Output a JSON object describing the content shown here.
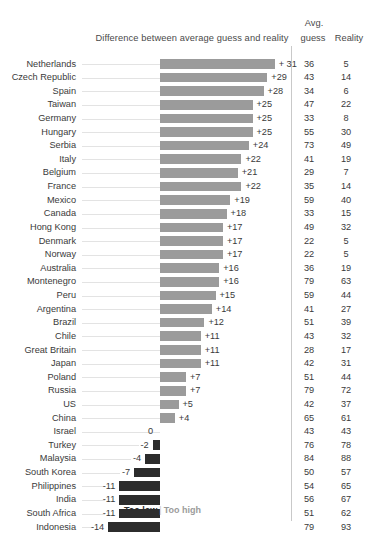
{
  "header": {
    "diff_title": "Difference between average guess and reality",
    "avg_line1": "Avg.",
    "avg_line2": "guess",
    "reality": "Reality"
  },
  "legend": {
    "too_low": "Too low",
    "separator": "|",
    "too_high": "Too high"
  },
  "colors": {
    "positive_bar": "#9b9b9b",
    "negative_bar": "#2c2c2c",
    "leader_line": "#e3e3e3",
    "divider": "#c9c9c9",
    "text": "#3a3a3a",
    "background": "#ffffff"
  },
  "chart_data": {
    "type": "bar",
    "title": "Difference between average guess and reality",
    "xlabel": "",
    "ylabel": "",
    "orientation": "horizontal",
    "grid": false,
    "legend_position": "bottom",
    "zero_line_px": 160,
    "px_per_unit": 3.7,
    "xlim": [
      -14,
      31
    ],
    "categories": [
      "Netherlands",
      "Czech Republic",
      "Spain",
      "Taiwan",
      "Germany",
      "Hungary",
      "Serbia",
      "Italy",
      "Belgium",
      "France",
      "Mexico",
      "Canada",
      "Hong Kong",
      "Denmark",
      "Norway",
      "Australia",
      "Montenegro",
      "Peru",
      "Argentina",
      "Brazil",
      "Chile",
      "Great Britain",
      "Japan",
      "Poland",
      "Russia",
      "US",
      "China",
      "Israel",
      "Turkey",
      "Malaysia",
      "South Korea",
      "Philippines",
      "India",
      "South Africa",
      "Indonesia"
    ],
    "series": [
      {
        "name": "Difference",
        "values": [
          31,
          29,
          28,
          25,
          25,
          25,
          24,
          22,
          21,
          22,
          19,
          18,
          17,
          17,
          17,
          16,
          16,
          15,
          14,
          12,
          11,
          11,
          11,
          7,
          7,
          5,
          4,
          0,
          -2,
          -4,
          -7,
          -11,
          -11,
          -11,
          -14
        ]
      },
      {
        "name": "Avg. guess",
        "values": [
          36,
          43,
          34,
          47,
          33,
          55,
          73,
          41,
          29,
          35,
          59,
          33,
          49,
          22,
          22,
          36,
          79,
          59,
          41,
          51,
          43,
          28,
          42,
          51,
          79,
          42,
          65,
          43,
          76,
          84,
          50,
          54,
          56,
          51,
          79
        ]
      },
      {
        "name": "Reality",
        "values": [
          5,
          14,
          6,
          22,
          8,
          30,
          49,
          19,
          7,
          14,
          40,
          15,
          32,
          5,
          5,
          19,
          63,
          44,
          27,
          39,
          32,
          17,
          31,
          44,
          72,
          37,
          61,
          43,
          78,
          88,
          57,
          65,
          67,
          62,
          93
        ]
      }
    ],
    "value_labels": [
      "+ 31",
      "+29",
      "+28",
      "+25",
      "+25",
      "+25",
      "+24",
      "+22",
      "+21",
      "+22",
      "+19",
      "+18",
      "+17",
      "+17",
      "+17",
      "+16",
      "+16",
      "+15",
      "+14",
      "+12",
      "+11",
      "+11",
      "+11",
      "+7",
      "+7",
      "+5",
      "+4",
      "0",
      "-2",
      "-4",
      "-7",
      "-11",
      "-11",
      "-11",
      "-14"
    ]
  }
}
